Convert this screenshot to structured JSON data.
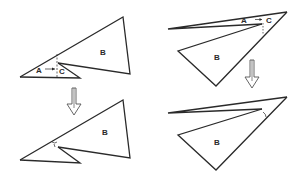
{
  "figure": {
    "panels": [
      {
        "id": "top-left",
        "labels": {
          "a": "A",
          "b": "B",
          "c": "C"
        },
        "description": "Triangle B with small triangle A beneath; arrow from A pointing to C"
      },
      {
        "id": "top-right",
        "labels": {
          "a": "A",
          "b": "B",
          "c": "C"
        },
        "description": "Long thin sliver A above triangle B; arrow from A pointing to C"
      },
      {
        "id": "bottom-left",
        "labels": {
          "b": "B"
        },
        "description": "Result after transformation"
      },
      {
        "id": "bottom-right",
        "labels": {
          "b": "B"
        },
        "description": "Result after transformation"
      }
    ],
    "arrows": [
      {
        "id": "left-down-arrow",
        "direction": "down"
      },
      {
        "id": "right-down-arrow",
        "direction": "down"
      }
    ],
    "colors": {
      "stroke": "#2a2a2a",
      "arrow_outline": "#555555",
      "background": "#ffffff"
    }
  }
}
